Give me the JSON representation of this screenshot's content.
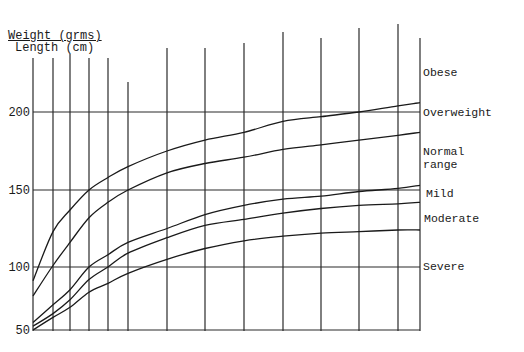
{
  "chart_data": {
    "type": "line",
    "xlabel": "",
    "ylabel": "Weight (grms) / Length (cm)",
    "header": {
      "line1": "Weight (grms)",
      "line2": "Length (cm)"
    },
    "ylim": [
      50,
      220
    ],
    "yticks": [
      50,
      100,
      150,
      200
    ],
    "ytick_labels": [
      "50",
      "100",
      "150",
      "200"
    ],
    "grid": true,
    "x": [
      0,
      1,
      2,
      3,
      4,
      5,
      6,
      7,
      8,
      9,
      10,
      11,
      12,
      13
    ],
    "series": [
      {
        "name": "Overweight boundary",
        "values": [
          89,
          123,
          137,
          150,
          158,
          165,
          175,
          182,
          187,
          194,
          197,
          200,
          204,
          206
        ]
      },
      {
        "name": "Normal range / Mild boundary",
        "values": [
          77,
          101,
          116,
          132,
          142,
          150,
          161,
          167,
          171,
          176,
          179,
          182,
          185,
          187
        ]
      },
      {
        "name": "Mild / Moderate boundary",
        "values": [
          56,
          70,
          82,
          100,
          108,
          116,
          125,
          134,
          140,
          144,
          146,
          149,
          151,
          153
        ]
      },
      {
        "name": "Moderate / Severe boundary",
        "values": [
          53,
          63,
          74,
          90,
          100,
          109,
          119,
          127,
          131,
          135,
          138,
          140,
          141,
          142
        ]
      },
      {
        "name": "Severe boundary",
        "values": [
          50,
          60,
          68,
          80,
          87,
          95,
          105,
          112,
          117,
          120,
          122,
          123,
          124,
          124
        ]
      }
    ],
    "region_labels": [
      {
        "text": "Obese",
        "y_value": 225
      },
      {
        "text": "Overweight",
        "y_value": 200
      },
      {
        "text": "Normal\nrange",
        "y_value": 172
      },
      {
        "text": "Mild",
        "y_value": 148
      },
      {
        "text": "Moderate",
        "y_value": 131
      },
      {
        "text": "Severe",
        "y_value": 100
      }
    ],
    "legend_position": "right"
  }
}
